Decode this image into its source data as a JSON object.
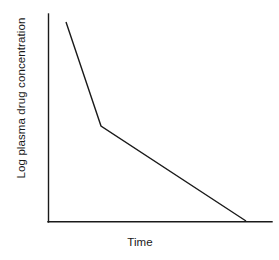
{
  "figure": {
    "background_color": "#ffffff",
    "line_color": "#1a1a1a",
    "text_color": "#1a1a1a",
    "width": 279,
    "height": 260
  },
  "axes": {
    "x_label": "Time",
    "y_label": "Log plasma drug concentration",
    "x_axis_name": "x-axis",
    "y_axis_name": "y-axis"
  },
  "chart_data": {
    "type": "line",
    "title": "",
    "subtitle": "",
    "xlabel": "Time",
    "ylabel": "Log plasma drug concentration",
    "xlim": [
      0,
      1
    ],
    "ylim": [
      0,
      1
    ],
    "grid": false,
    "legend": false,
    "legend_position": "none",
    "xticks": [],
    "yticks": [],
    "xticklabels": [],
    "yticklabels": [],
    "annotations": [],
    "series": [
      {
        "name": "Log plasma drug concentration",
        "color": "#1a1a1a",
        "x": [
          0.08,
          0.237,
          0.884
        ],
        "y": [
          0.962,
          0.462,
          0.005
        ],
        "points_px": [
          {
            "phase": "distribution-start",
            "x": 66,
            "y": 22
          },
          {
            "phase": "breakpoint",
            "x": 101,
            "y": 126
          },
          {
            "phase": "elimination-end",
            "x": 246,
            "y": 221
          }
        ]
      }
    ]
  }
}
